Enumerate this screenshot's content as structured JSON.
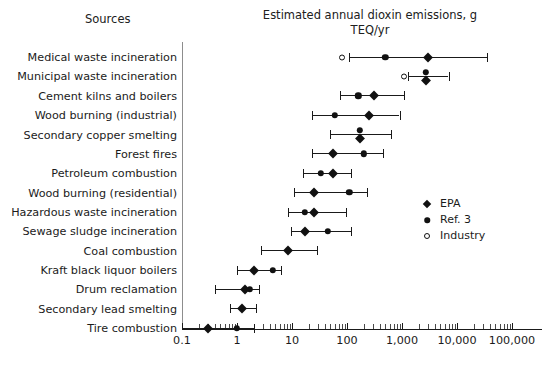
{
  "header": {
    "sources_label": "Sources",
    "chart_title": "Estimated annual dioxin emissions, g TEQ/yr"
  },
  "legend": {
    "position": "right-middle",
    "items": [
      {
        "label": "EPA",
        "marker": "filled-diamond",
        "color": "#111111"
      },
      {
        "label": "Ref. 3",
        "marker": "filled-circle",
        "color": "#111111"
      },
      {
        "label": "Industry",
        "marker": "open-circle",
        "color": "#111111"
      }
    ]
  },
  "axis": {
    "scale": "log10",
    "ticks": [
      "0.1",
      "1",
      "10",
      "100",
      "1,000",
      "10,000",
      "100,000"
    ],
    "range": [
      0.1,
      200000
    ]
  },
  "chart_data": {
    "type": "scatter",
    "title": "Estimated annual dioxin emissions, g TEQ/yr",
    "xlabel": "Estimated annual dioxin emissions, g TEQ/yr",
    "ylabel": "Sources",
    "xscale": "log",
    "xlim": [
      0.1,
      200000
    ],
    "xticks": [
      0.1,
      1,
      10,
      100,
      1000,
      10000,
      100000
    ],
    "xticklabels": [
      "0.1",
      "1",
      "10",
      "100",
      "1,000",
      "10,000",
      "100,000"
    ],
    "grid": false,
    "legend_position": "right",
    "series": [
      "EPA",
      "Ref. 3",
      "Industry"
    ],
    "categories": [
      "Medical waste incineration",
      "Municipal waste incineration",
      "Cement kilns and boilers",
      "Wood burning (industrial)",
      "Secondary copper smelting",
      "Forest fires",
      "Petroleum combustion",
      "Wood burning (residential)",
      "Hazardous waste incineration",
      "Sewage sludge incineration",
      "Coal combustion",
      "Kraft black liquor boilers",
      "Drum reclamation",
      "Secondary lead smelting",
      "Tire combustion"
    ],
    "rows": [
      {
        "category": "Medical waste incineration",
        "low": 110,
        "high": 35000,
        "epa": 3000,
        "ref3": 500,
        "industry": 80
      },
      {
        "category": "Municipal waste incineration",
        "low": 1300,
        "high": 7000,
        "epa": 2700,
        "ref3": 2700,
        "industry": 1100
      },
      {
        "category": "Cement kilns and boilers",
        "low": 75,
        "high": 1100,
        "epa": 310,
        "ref3": 160,
        "industry": null
      },
      {
        "category": "Wood burning (industrial)",
        "low": 23,
        "high": 900,
        "epa": 250,
        "ref3": 60,
        "industry": null
      },
      {
        "category": "Secondary copper smelting",
        "low": 50,
        "high": 640,
        "epa": 170,
        "ref3": 170,
        "industry": null
      },
      {
        "category": "Forest fires",
        "low": 23,
        "high": 450,
        "epa": 55,
        "ref3": 200,
        "industry": null
      },
      {
        "category": "Petroleum combustion",
        "low": 16,
        "high": 120,
        "epa": 55,
        "ref3": 33,
        "industry": null
      },
      {
        "category": "Wood burning (residential)",
        "low": 11,
        "high": 230,
        "epa": 25,
        "ref3": 110,
        "industry": null
      },
      {
        "category": "Hazardous waste incineration",
        "low": 8.5,
        "high": 95,
        "epa": 25,
        "ref3": 17,
        "industry": null
      },
      {
        "category": "Sewage sludge incineration",
        "low": 9.5,
        "high": 120,
        "epa": 17,
        "ref3": 45,
        "industry": null
      },
      {
        "category": "Coal combustion",
        "low": 2.7,
        "high": 28,
        "epa": 8.5,
        "ref3": null,
        "industry": null
      },
      {
        "category": "Kraft black liquor boilers",
        "low": 1.0,
        "high": 6.3,
        "epa": 2.0,
        "ref3": 4.5,
        "industry": null
      },
      {
        "category": "Drum reclamation",
        "low": 0.4,
        "high": 2.5,
        "epa": 1.4,
        "ref3": 1.7,
        "industry": null
      },
      {
        "category": "Secondary lead smelting",
        "low": 0.75,
        "high": 2.2,
        "epa": 1.25,
        "ref3": null,
        "industry": null
      },
      {
        "category": "Tire combustion",
        "low": 0.1,
        "high": 2.0,
        "epa": 0.3,
        "ref3": 1.0,
        "industry": null
      }
    ]
  }
}
